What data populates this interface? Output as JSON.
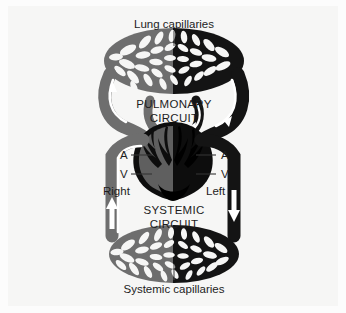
{
  "figure": {
    "background_color": "#f6f6f5",
    "page_color": "#fcfcfc"
  },
  "labels": {
    "top_capillaries": "Lung capillaries",
    "bottom_capillaries": "Systemic capillaries",
    "pulmonary_line1": "PULMONARY",
    "pulmonary_line2": "CIRCUIT",
    "systemic_line1": "SYSTEMIC",
    "systemic_line2": "CIRCUIT",
    "left_atrium": "A",
    "left_ventricle": "V",
    "left_side": "Right",
    "right_atrium": "A",
    "right_ventricle": "V",
    "right_side": "Left"
  },
  "colors": {
    "deoxygenated": "#6e6e6e",
    "oxygenated": "#141414",
    "heart_dark": "#0d0d0d",
    "heart_mid": "#5f5f5f",
    "arrow": "#ffffff",
    "leader_line": "#4a4a4a",
    "text": "#1d1d1d"
  },
  "diagram_data": {
    "type": "flow-diagram",
    "subject": "mammalian double circulatory system",
    "circuits": [
      {
        "name": "PULMONARY CIRCUIT",
        "position": "top",
        "capillary_bed": "Lung capillaries",
        "inflow_side": "left",
        "inflow_blood": "deoxygenated",
        "outflow_side": "right",
        "outflow_blood": "oxygenated"
      },
      {
        "name": "SYSTEMIC CIRCUIT",
        "position": "bottom",
        "capillary_bed": "Systemic capillaries",
        "inflow_side": "right",
        "inflow_blood": "oxygenated",
        "outflow_side": "left",
        "outflow_blood": "deoxygenated"
      }
    ],
    "heart_chambers": [
      {
        "side": "Right",
        "chamber": "A",
        "name": "atrium",
        "blood": "deoxygenated"
      },
      {
        "side": "Right",
        "chamber": "V",
        "name": "ventricle",
        "blood": "deoxygenated"
      },
      {
        "side": "Left",
        "chamber": "A",
        "name": "atrium",
        "blood": "oxygenated"
      },
      {
        "side": "Left",
        "chamber": "V",
        "name": "ventricle",
        "blood": "oxygenated"
      }
    ],
    "flow_arrows": [
      {
        "location": "left-lung-vessel",
        "direction": "up"
      },
      {
        "location": "right-lung-vessel",
        "direction": "down"
      },
      {
        "location": "left-systemic-vessel",
        "direction": "up"
      },
      {
        "location": "right-systemic-vessel",
        "direction": "down"
      }
    ]
  }
}
